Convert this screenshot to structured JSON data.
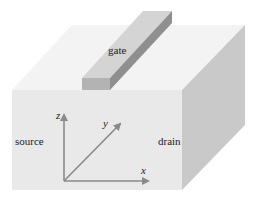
{
  "diagram": {
    "labels": {
      "gate": "gate",
      "source": "source",
      "drain": "drain"
    },
    "axes": {
      "x": "x",
      "y": "y",
      "z": "z"
    },
    "colors": {
      "background": "#ffffff",
      "top_face": "#f3f3f3",
      "front_face": "#e9e9e9",
      "side_face": "#c9c9c9",
      "gate_top": "#d4d4d4",
      "gate_front": "#b3b3b3",
      "gate_side": "#8f8f8f",
      "axis": "#8a8a8a"
    }
  }
}
